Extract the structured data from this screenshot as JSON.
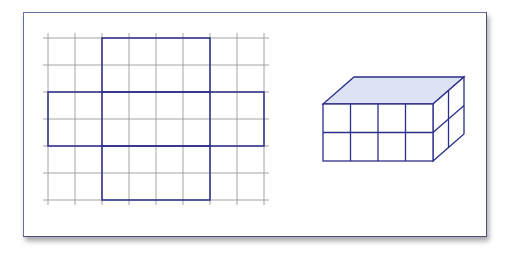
{
  "diagram": {
    "colors": {
      "frame_border": "#6a6fa3",
      "grid_line": "#9a9a9a",
      "outline": "#2b2f8a",
      "top_face_fill": "#dde3f5"
    },
    "grid": {
      "columns": 8,
      "rows": 6,
      "cell_px": 27,
      "origin": [
        48,
        38
      ]
    },
    "net": {
      "top_rect": {
        "col": 2,
        "row": 0,
        "w": 4,
        "h": 2
      },
      "middle_band": {
        "col": 0,
        "row": 2,
        "w": 8,
        "h": 2
      },
      "bottom_rect": {
        "col": 2,
        "row": 4,
        "w": 4,
        "h": 2
      }
    },
    "cuboid": {
      "length": 4,
      "width": 2,
      "height": 2,
      "front_face_divisions": {
        "columns": 4,
        "rows": 2
      },
      "side_face_divisions": {
        "columns": 2,
        "rows": 2
      },
      "top_face_shaded": true
    }
  }
}
